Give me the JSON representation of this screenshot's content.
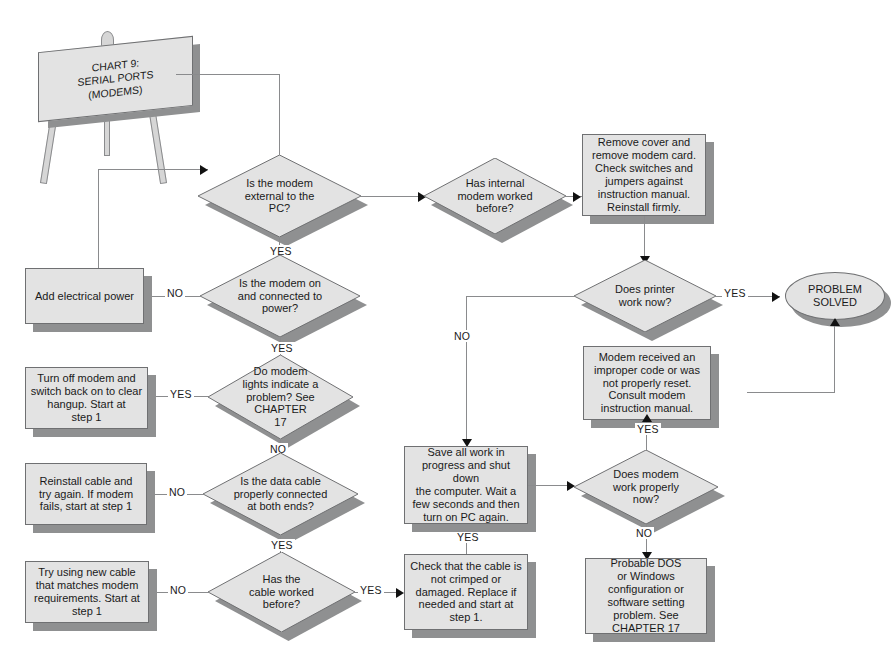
{
  "title_board": {
    "text": "CHART 9:\nSERIAL PORTS\n(MODEMS)"
  },
  "labels": {
    "yes": "YES",
    "no": "NO"
  },
  "nodes": {
    "d_external": "Is the modem\nexternal to the\nPC?",
    "d_internal_worked": "Has internal\nmodem worked\nbefore?",
    "p_remove_cover": "Remove cover and\nremove modem card.\nCheck switches and\njumpers against\ninstruction manual.\nReinstall firmly.",
    "d_printer_work": "Does printer\nwork now?",
    "o_problem_solved": "PROBLEM\nSOLVED",
    "d_modem_on": "Is the modem on\nand connected to\npower?",
    "p_add_power": "Add electrical power",
    "d_modem_lights": "Do modem\nlights indicate a\nproblem? See\nCHAPTER\n17",
    "p_turn_off_modem": "Turn off modem and\nswitch back on to clear\nhangup. Start at\nstep 1",
    "d_data_cable": "Is the data cable\nproperly connected\nat both ends?",
    "p_reinstall_cable": "Reinstall cable and\ntry again. If modem\nfails, start at step 1",
    "d_cable_worked": "Has the\ncable worked\nbefore?",
    "p_try_new_cable": "Try using new cable\nthat matches modem\nrequirements. Start at\nstep 1",
    "p_check_cable": "Check that the cable is\nnot crimped or\ndamaged. Replace if\nneeded and start at\nstep 1.",
    "p_save_work": "Save all work in\nprogress and shut down\nthe computer. Wait a\nfew seconds and then\nturn on PC again.",
    "p_modem_code": "Modem received an\nimproper code or was\nnot properly reset.\nConsult modem\ninstruction manual.",
    "d_modem_properly": "Does modem\nwork properly\nnow?",
    "p_probable_dos": "Probable DOS\nor Windows\nconfiguration or\nsoftware setting\nproblem. See\nCHAPTER 17"
  },
  "colors": {
    "node_fill": "#e3e3e3",
    "node_shadow": "#8f9091",
    "node_stroke": "#6f7072",
    "connector": "#8a8b8d",
    "text": "#1a1a1a",
    "page": "#ffffff"
  }
}
